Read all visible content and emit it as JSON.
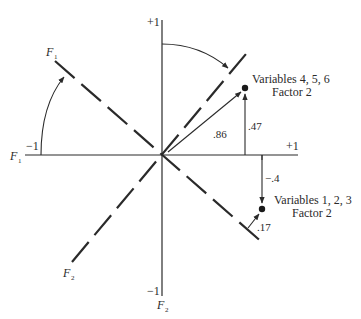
{
  "diagram": {
    "type": "factor-rotation",
    "axes": {
      "vertical": {
        "top_label": "+1",
        "bottom_label": "−1",
        "axis_name": "F",
        "axis_sub": "2"
      },
      "horizontal": {
        "left_label": "−1",
        "right_label": "+1",
        "axis_name": "F",
        "axis_sub": "1"
      }
    },
    "rotated_axes": {
      "f1": {
        "name": "F",
        "sub": "1"
      },
      "f2": {
        "name": "F",
        "sub": "2"
      }
    },
    "points": [
      {
        "label_line1": "Variables 4, 5, 6",
        "label_line2": "Factor 2",
        "projection_rotated": ".86",
        "projection_original": ".47"
      },
      {
        "label_line1": "Variables 1, 2, 3",
        "label_line2": "Factor 2",
        "projection_rotated": ".17",
        "projection_original": "−.4"
      }
    ]
  },
  "colors": {
    "ink": "#2a2a2a",
    "background": "#ffffff"
  }
}
